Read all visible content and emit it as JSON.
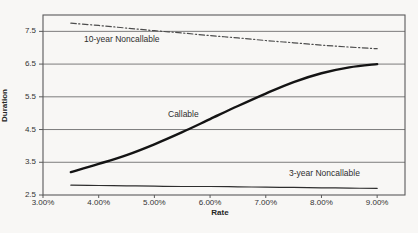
{
  "figure": {
    "background": "#f8f7f5",
    "text_color": "#2e2e2e",
    "grid_color": "#6e6e6e",
    "border_color": "#5a5a5a"
  },
  "chart_data": {
    "type": "line",
    "title": "",
    "xlabel": "Rate",
    "ylabel": "Duration",
    "xlim": [
      3.0,
      9.5
    ],
    "ylim": [
      2.5,
      8.0
    ],
    "grid": "horizontal",
    "legend_position": "inline-labels",
    "x_ticks": [
      "3.00%",
      "4.00%",
      "5.00%",
      "6.00%",
      "7.00%",
      "8.00%",
      "9.00%"
    ],
    "x_tick_values": [
      3,
      4,
      5,
      6,
      7,
      8,
      9
    ],
    "y_ticks": [
      "2.5",
      "3.5",
      "4.5",
      "5.5",
      "6.5",
      "7.5"
    ],
    "y_tick_values": [
      2.5,
      3.5,
      4.5,
      5.5,
      6.5,
      7.5
    ],
    "x": [
      3.5,
      4.0,
      4.5,
      5.0,
      5.5,
      6.0,
      6.5,
      7.0,
      7.5,
      8.0,
      8.5,
      9.0
    ],
    "series": [
      {
        "name": "10-year Noncallable",
        "values": [
          7.75,
          7.68,
          7.6,
          7.52,
          7.45,
          7.37,
          7.3,
          7.22,
          7.15,
          7.08,
          7.02,
          6.97
        ],
        "line_style": "dashdot",
        "line_width": 1.2,
        "color": "#4d4d4d"
      },
      {
        "name": "Callable",
        "values": [
          3.2,
          3.45,
          3.72,
          4.05,
          4.42,
          4.82,
          5.22,
          5.6,
          5.95,
          6.22,
          6.4,
          6.5
        ],
        "line_style": "solid",
        "line_width": 2.4,
        "color": "#141414"
      },
      {
        "name": "3-year Noncallable",
        "values": [
          2.8,
          2.79,
          2.78,
          2.77,
          2.76,
          2.76,
          2.75,
          2.74,
          2.73,
          2.72,
          2.71,
          2.7
        ],
        "line_style": "solid",
        "line_width": 1.2,
        "color": "#2e2e2e"
      }
    ]
  }
}
